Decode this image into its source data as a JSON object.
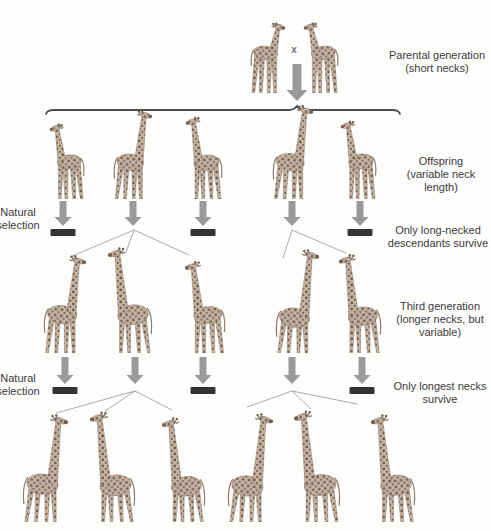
{
  "labels": {
    "cross": "x",
    "parental": {
      "lines": [
        "Parental generation",
        "(short necks)"
      ]
    },
    "offspring": {
      "lines": [
        "Offspring",
        "(variable neck",
        "length)"
      ]
    },
    "natural_selection_1": {
      "lines": [
        "Natural",
        "selection"
      ]
    },
    "survive_1": {
      "lines": [
        "Only long-necked",
        "descendants survive"
      ]
    },
    "third_generation": {
      "lines": [
        "Third generation",
        "(longer necks, but",
        "variable)"
      ]
    },
    "natural_selection_2": {
      "lines": [
        "Natural",
        "selection"
      ]
    },
    "survive_2": {
      "lines": [
        "Only longest necks",
        "survive"
      ]
    }
  },
  "colors": {
    "background": "#fdfdfc",
    "text": "#3b3b3b",
    "arrow": "#9a9a9a",
    "bar": "#333333",
    "brace": "#4d4d4d",
    "branch_line": "#aaaaaa",
    "giraffe_base": "#c6b3a2",
    "giraffe_spot": "#6e5f51",
    "giraffe_outline": "#8f7d6b"
  },
  "diagram": {
    "top_arrow": {
      "x": 297,
      "y1": 64,
      "y2": 101
    },
    "brace": {
      "x1": 46,
      "x2": 400,
      "peak_x": 297,
      "y": 110
    },
    "generations": [
      {
        "name": "parents",
        "baseline": 93,
        "giraffes": [
          {
            "x": 268,
            "h": 71,
            "neck": 0.34,
            "flip": true
          },
          {
            "x": 321,
            "h": 71,
            "neck": 0.34,
            "flip": false
          }
        ]
      },
      {
        "name": "offspring",
        "baseline": 199,
        "giraffes": [
          {
            "x": 67,
            "h": 76,
            "neck": 0.42,
            "flip": false
          },
          {
            "x": 133,
            "h": 90,
            "neck": 0.5,
            "flip": true
          },
          {
            "x": 204,
            "h": 83,
            "neck": 0.47,
            "flip": false
          },
          {
            "x": 293,
            "h": 95,
            "neck": 0.52,
            "flip": true
          },
          {
            "x": 358,
            "h": 79,
            "neck": 0.43,
            "flip": false
          }
        ]
      },
      {
        "name": "third-generation",
        "baseline": 353,
        "giraffes": [
          {
            "x": 65,
            "h": 99,
            "neck": 0.52,
            "flip": true
          },
          {
            "x": 130,
            "h": 107,
            "neck": 0.55,
            "flip": false
          },
          {
            "x": 205,
            "h": 93,
            "neck": 0.5,
            "flip": false
          },
          {
            "x": 297,
            "h": 105,
            "neck": 0.57,
            "flip": true
          },
          {
            "x": 360,
            "h": 100,
            "neck": 0.54,
            "flip": false
          }
        ]
      },
      {
        "name": "fourth-generation",
        "baseline": 522,
        "giraffes": [
          {
            "x": 45,
            "h": 109,
            "neck": 0.56,
            "flip": true
          },
          {
            "x": 112,
            "h": 112,
            "neck": 0.58,
            "flip": false
          },
          {
            "x": 183,
            "h": 106,
            "neck": 0.57,
            "flip": false
          },
          {
            "x": 250,
            "h": 110,
            "neck": 0.58,
            "flip": true
          },
          {
            "x": 317,
            "h": 113,
            "neck": 0.58,
            "flip": false
          },
          {
            "x": 393,
            "h": 109,
            "neck": 0.57,
            "flip": false
          }
        ]
      }
    ],
    "selection_rows": [
      {
        "arrows_y": [
          201,
          226
        ],
        "bars_y": 229,
        "arrows": [
          63,
          133,
          203,
          292,
          360
        ],
        "bars": [
          63,
          203,
          360
        ],
        "branches": [
          {
            "apex": [
              134,
              230
            ],
            "targets": [
              [
                70,
                257
              ],
              [
                126,
                252
              ],
              [
                189,
                255
              ]
            ]
          },
          {
            "apex": [
              292,
              230
            ],
            "targets": [
              [
                283,
                258
              ],
              [
                346,
                253
              ]
            ]
          }
        ]
      },
      {
        "arrows_y": [
          357,
          384
        ],
        "bars_y": 387,
        "arrows": [
          65,
          135,
          203,
          292,
          362
        ],
        "bars": [
          65,
          203,
          362
        ],
        "branches": [
          {
            "apex": [
              135,
              391
            ],
            "targets": [
              [
                56,
                413
              ],
              [
                105,
                411
              ],
              [
                172,
                410
              ]
            ]
          },
          {
            "apex": [
              292,
              391
            ],
            "targets": [
              [
                247,
                407
              ],
              [
                311,
                409
              ],
              [
                357,
                404
              ]
            ]
          }
        ]
      }
    ]
  }
}
